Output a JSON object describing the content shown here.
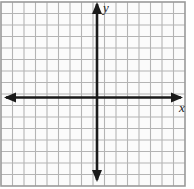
{
  "figure": {
    "type": "cartesian-grid"
  },
  "labels": {
    "y_axis": "y",
    "x_axis": "x"
  },
  "colors": {
    "grid_line": "#b4b4b4",
    "grid_background": "#fbfbfb",
    "border": "#9a9a9a",
    "axis": "#1a1a1a"
  },
  "chart_data": {
    "type": "scatter",
    "title": "",
    "xlabel": "x",
    "ylabel": "y",
    "x": [],
    "y": [],
    "series": [],
    "xlim": [
      -8,
      8
    ],
    "ylim": [
      -8,
      8
    ],
    "x_ticks": [
      -8,
      -7,
      -6,
      -5,
      -4,
      -3,
      -2,
      -1,
      0,
      1,
      2,
      3,
      4,
      5,
      6,
      7,
      8
    ],
    "y_ticks": [
      -8,
      -7,
      -6,
      -5,
      -4,
      -3,
      -2,
      -1,
      0,
      1,
      2,
      3,
      4,
      5,
      6,
      7,
      8
    ],
    "x_tick_labels": [],
    "y_tick_labels": [],
    "grid": true,
    "grid_columns": 16,
    "grid_rows": 16,
    "legend": null,
    "annotations": [],
    "axis_arrows": "both",
    "origin": [
      97,
      97.5
    ]
  },
  "geometry": {
    "grid_left": 1,
    "grid_top": 2,
    "grid_right": 185,
    "grid_bottom": 186,
    "cell_size": 11.5,
    "axis_x_y": 97.5,
    "axis_y_x": 97,
    "x_arrow_left_tip": 4,
    "x_arrow_right_tip": 183,
    "y_arrow_top_tip": 2,
    "y_arrow_bottom_tip": 182
  }
}
